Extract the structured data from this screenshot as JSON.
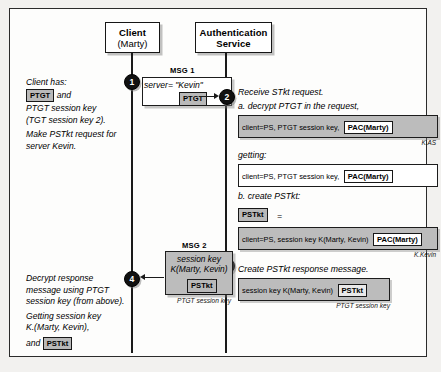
{
  "diagram": {
    "actors": [
      {
        "name": "client",
        "line1": "Client",
        "line2": "(Marty)"
      },
      {
        "name": "authentication-service",
        "line1": "Authentication",
        "line2": "Service"
      }
    ],
    "steps": [
      {
        "number": "1"
      },
      {
        "number": "2"
      },
      {
        "number": "3"
      },
      {
        "number": "4"
      }
    ],
    "messages": {
      "msg1": {
        "label": "MSG 1",
        "field_key": "server=",
        "field_value": "\"Kevin\"",
        "token": "PTGT"
      },
      "msg2": {
        "label": "MSG 2",
        "line1": "session key",
        "line2": "K(Marty, Kevin)",
        "token": "PSTkt",
        "encryption_note": "PTGT session key"
      }
    },
    "left_notes": {
      "step1": {
        "line1": "Client has:",
        "token1": "PTGT",
        "line1_tail": "and",
        "line2": "PTGT session key",
        "line3": "(TGT session key 2).",
        "line4": "Make PSTkt request for",
        "line5": "server Kevin."
      },
      "step4": {
        "line1": "Decrypt response",
        "line2": "message using PTGT",
        "line3": "session key (from above).",
        "line4": "Getting session key",
        "line5": "K.(Marty, Kevin),",
        "line6_head": "and",
        "token": "PSTkt"
      }
    },
    "right_notes": {
      "step2": {
        "heading": "Receive STkt request.",
        "sub_a": "a. decrypt PTGT in the request,",
        "box_a_text": "client=PS, PTGT session key,",
        "box_a_token": "PAC(Marty)",
        "box_a_keysub": "K.AS",
        "getting_label": "getting:",
        "box_b_text": "client=PS, PTGT session key,",
        "box_b_token": "PAC(Marty)",
        "sub_b": "b. create PSTkt:",
        "pstkt_token": "PSTkt",
        "equals": "=",
        "box_c_text": "client=PS, session key K(Marty, Kevin)",
        "box_c_token": "PAC(Marty)",
        "box_c_keysub": "K.Kevin"
      },
      "step3": {
        "heading": "Create PSTkt response message.",
        "box_text": "session key K(Marty, Kevin)",
        "box_token": "PSTkt",
        "keysub": "PTGT session key"
      }
    },
    "colors": {
      "frame_border": "#2b2b2b",
      "box_fill": "#bcbcbc",
      "chip_fill": "#b9b9b9",
      "line": "#1a1a1a",
      "bullet": "#111111",
      "page_background": "#f2f1ef"
    }
  }
}
